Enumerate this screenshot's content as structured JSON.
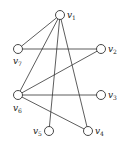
{
  "diagram": {
    "type": "graph",
    "directed": false,
    "node_radius": 4.5,
    "colors": {
      "stroke": "#333333",
      "fill": "#ffffff",
      "text": "#222222"
    },
    "nodes": [
      {
        "id": "v1",
        "base": "v",
        "sub": "1",
        "x": 60,
        "y": 15,
        "lx": 67,
        "ly": 18
      },
      {
        "id": "v2",
        "base": "v",
        "sub": "2",
        "x": 101,
        "y": 49,
        "lx": 108,
        "ly": 52
      },
      {
        "id": "v3",
        "base": "v",
        "sub": "3",
        "x": 101,
        "y": 95,
        "lx": 108,
        "ly": 98
      },
      {
        "id": "v4",
        "base": "v",
        "sub": "4",
        "x": 88,
        "y": 131,
        "lx": 95,
        "ly": 134
      },
      {
        "id": "v5",
        "base": "v",
        "sub": "5",
        "x": 49,
        "y": 131,
        "lx": 33,
        "ly": 134
      },
      {
        "id": "v6",
        "base": "v",
        "sub": "6",
        "x": 18,
        "y": 95,
        "lx": 13,
        "ly": 111
      },
      {
        "id": "v7",
        "base": "v",
        "sub": "7",
        "x": 18,
        "y": 49,
        "lx": 13,
        "ly": 64
      }
    ],
    "edges": [
      [
        "v1",
        "v7"
      ],
      [
        "v1",
        "v6"
      ],
      [
        "v1",
        "v5"
      ],
      [
        "v1",
        "v4"
      ],
      [
        "v7",
        "v2"
      ],
      [
        "v6",
        "v2"
      ],
      [
        "v6",
        "v3"
      ],
      [
        "v6",
        "v4"
      ]
    ]
  }
}
